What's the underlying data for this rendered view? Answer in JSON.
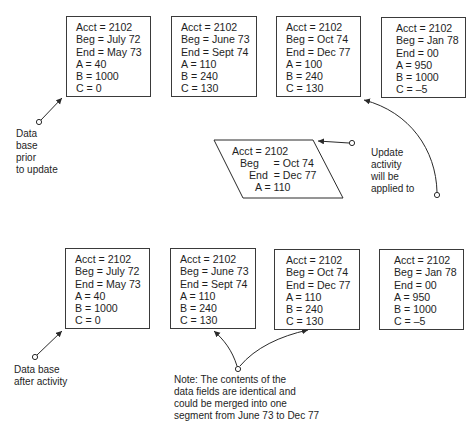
{
  "before": {
    "label": [
      "Data",
      "base",
      "prior",
      "to update"
    ],
    "records": [
      {
        "lines": [
          "Acct = 2102",
          "Beg = July 72",
          "End = May 73",
          "A = 40",
          "B = 1000",
          "C = 0"
        ]
      },
      {
        "lines": [
          "Acct = 2102",
          "Beg = June 73",
          "End = Sept 74",
          "A = 110",
          "B = 240",
          "C = 130"
        ]
      },
      {
        "lines": [
          "Acct = 2102",
          "Beg = Oct 74",
          "End = Dec 77",
          "A = 100",
          "B = 240",
          "C = 130"
        ]
      },
      {
        "lines": [
          "Acct = 2102",
          "Beg = Jan 78",
          "End = 00",
          "A = 950",
          "B = 1000",
          "C = –5"
        ]
      }
    ]
  },
  "update": {
    "lines": [
      "Acct = 2102",
      "Beg     = Oct 74",
      "End  = Dec 77",
      "A = 110"
    ],
    "label": [
      "Update",
      "activity",
      "will be",
      "applied to"
    ]
  },
  "after": {
    "label": [
      "Data base",
      "after activity"
    ],
    "records": [
      {
        "lines": [
          "Acct = 2102",
          "Beg = July 72",
          "End = May 73",
          "A = 40",
          "B = 1000",
          "C = 0"
        ]
      },
      {
        "lines": [
          "Acct = 2102",
          "Beg = June 73",
          "End = Sept 74",
          "A = 110",
          "B = 240",
          "C = 130"
        ]
      },
      {
        "lines": [
          "Acct = 2102",
          "Beg = Oct 74",
          "End = Dec 77",
          "A = 110",
          "B = 240",
          "C = 130"
        ]
      },
      {
        "lines": [
          "Acct = 2102",
          "Beg = Jan 78",
          "End = 00",
          "A = 950",
          "B = 1000",
          "C = –5"
        ]
      }
    ]
  },
  "note": [
    "Note: The contents of the",
    "data fields are identical and",
    "could be merged into one",
    "segment from June 73 to Dec 77"
  ]
}
